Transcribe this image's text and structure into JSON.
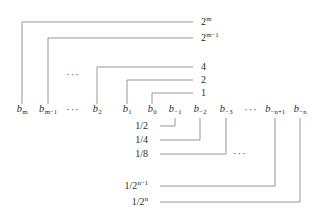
{
  "figure": {
    "line_color": "#8a8a8a",
    "text_color": "#2b2b2b",
    "background_color": "#ffffff",
    "line_width": 0.9
  },
  "bits": [
    {
      "id": "b-m",
      "base": "b",
      "sub": "m",
      "x": 22
    },
    {
      "id": "b-m-1",
      "base": "b",
      "sub": "m−1",
      "x": 48
    },
    {
      "id": "b-2",
      "base": "b",
      "sub": "2",
      "x": 97
    },
    {
      "id": "b-1",
      "base": "b",
      "sub": "1",
      "x": 127
    },
    {
      "id": "b-0",
      "base": "b",
      "sub": "0",
      "x": 152
    },
    {
      "id": "b-neg-1",
      "base": "b",
      "sub": "−1",
      "x": 175
    },
    {
      "id": "b-neg-2",
      "base": "b",
      "sub": "−2",
      "x": 200
    },
    {
      "id": "b-neg-3",
      "base": "b",
      "sub": "−3",
      "x": 226
    },
    {
      "id": "b-neg-n-1",
      "base": "b",
      "sub": "−n+1",
      "x": 275
    },
    {
      "id": "b-neg-n",
      "base": "b",
      "sub": "−n",
      "x": 300
    }
  ],
  "bit_row_y": 112,
  "weights_upper": [
    {
      "id": "w-2m",
      "text": "2",
      "sup": "m",
      "x": 201,
      "y": 22,
      "leader_from": 165,
      "bit": "b-m"
    },
    {
      "id": "w-2m-1",
      "text": "2",
      "sup": "m−1",
      "x": 201,
      "y": 38,
      "leader_from": 165,
      "bit": "b-m-1"
    },
    {
      "id": "w-4",
      "text": "4",
      "sup": "",
      "x": 201,
      "y": 67,
      "leader_from": 165,
      "bit": "b-2"
    },
    {
      "id": "w-2",
      "text": "2",
      "sup": "",
      "x": 201,
      "y": 80,
      "leader_from": 165,
      "bit": "b-1"
    },
    {
      "id": "w-1",
      "text": "1",
      "sup": "",
      "x": 201,
      "y": 93,
      "leader_from": 165,
      "bit": "b-0"
    }
  ],
  "weights_lower": [
    {
      "id": "w-1-2",
      "text": "1/2",
      "sup": "",
      "x": 148,
      "y": 126,
      "leader_to": 158,
      "bit": "b-neg-1"
    },
    {
      "id": "w-1-4",
      "text": "1/4",
      "sup": "",
      "x": 148,
      "y": 140,
      "leader_to": 158,
      "bit": "b-neg-2"
    },
    {
      "id": "w-1-8",
      "text": "1/8",
      "sup": "",
      "x": 148,
      "y": 154,
      "leader_to": 158,
      "bit": "b-neg-3"
    },
    {
      "id": "w-1-2n-1",
      "text": "1/2",
      "sup": "n−1",
      "x": 148,
      "y": 186,
      "leader_to": 158,
      "bit": "b-neg-n-1"
    },
    {
      "id": "w-1-2n",
      "text": "1/2",
      "sup": "n",
      "x": 148,
      "y": 202,
      "leader_to": 158,
      "bit": "b-neg-n"
    }
  ],
  "ellipses": [
    {
      "id": "ellipsis-upper-left",
      "text": "···",
      "x": 73,
      "y": 75
    },
    {
      "id": "ellipsis-bit-row",
      "text": "···",
      "x": 73,
      "y": 110
    },
    {
      "id": "ellipsis-bit-row-right",
      "text": "···",
      "x": 251,
      "y": 110
    },
    {
      "id": "ellipsis-lower-right",
      "text": "···",
      "x": 240,
      "y": 154
    }
  ],
  "connectors": {
    "description": "Each bit connects by an elbow leader line to its place-value weight.",
    "upper": [
      {
        "id": "conn-b-m",
        "bit_x": 22,
        "tick_top": 104,
        "corner_y": 22,
        "end_x": 193
      },
      {
        "id": "conn-b-m-1",
        "bit_x": 48,
        "tick_top": 104,
        "corner_y": 38,
        "end_x": 193
      },
      {
        "id": "conn-b-2",
        "bit_x": 97,
        "tick_top": 104,
        "corner_y": 67,
        "end_x": 193
      },
      {
        "id": "conn-b-1",
        "bit_x": 127,
        "tick_top": 104,
        "corner_y": 80,
        "end_x": 193
      },
      {
        "id": "conn-b-0",
        "bit_x": 152,
        "tick_top": 104,
        "corner_y": 93,
        "end_x": 193
      }
    ],
    "lower": [
      {
        "id": "conn-b-neg-1",
        "bit_x": 175,
        "tick_bottom": 118,
        "corner_y": 126,
        "start_x": 160
      },
      {
        "id": "conn-b-neg-2",
        "bit_x": 200,
        "tick_bottom": 118,
        "corner_y": 140,
        "start_x": 160
      },
      {
        "id": "conn-b-neg-3",
        "bit_x": 226,
        "tick_bottom": 118,
        "corner_y": 154,
        "start_x": 160
      },
      {
        "id": "conn-b-neg-n-1",
        "bit_x": 275,
        "tick_bottom": 118,
        "corner_y": 186,
        "start_x": 160
      },
      {
        "id": "conn-b-neg-n",
        "bit_x": 300,
        "tick_bottom": 118,
        "corner_y": 202,
        "start_x": 160
      }
    ]
  }
}
